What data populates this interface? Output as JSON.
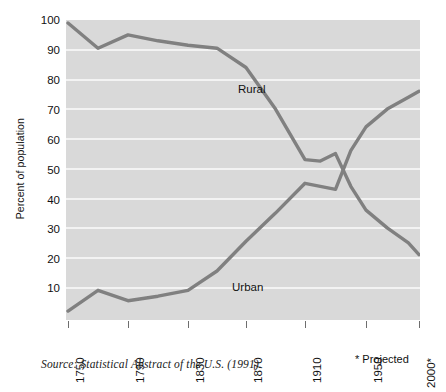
{
  "chart_data": {
    "type": "line",
    "title": "",
    "xlabel": "",
    "ylabel": "Percent of population",
    "xlim": [
      1750,
      2000
    ],
    "ylim": [
      0,
      100
    ],
    "grid": true,
    "legend": "inline-labels",
    "x_ticks": [
      "1750",
      "1790",
      "1830",
      "1870",
      "1910",
      "1950",
      "2000*"
    ],
    "x_tick_values": [
      1750,
      1790,
      1830,
      1870,
      1910,
      1950,
      2000
    ],
    "y_ticks": [
      "10",
      "20",
      "30",
      "40",
      "50",
      "60",
      "70",
      "80",
      "90",
      "100"
    ],
    "y_tick_values": [
      10,
      20,
      30,
      40,
      50,
      60,
      70,
      80,
      90,
      100
    ],
    "x": [
      1750,
      1770,
      1790,
      1810,
      1830,
      1850,
      1870,
      1890,
      1910,
      1920,
      1930,
      1940,
      1950,
      1970,
      1990,
      2000
    ],
    "series": [
      {
        "name": "Rural",
        "color": "#808080",
        "values": [
          99,
          90.5,
          95,
          93,
          91.5,
          90.5,
          84,
          70,
          53,
          52.5,
          55,
          44,
          36,
          30,
          25,
          21
        ]
      },
      {
        "name": "Urban",
        "color": "#808080",
        "values": [
          2,
          9,
          5.5,
          7,
          9,
          15.5,
          25.5,
          35,
          45,
          44,
          43,
          56,
          64,
          70,
          74,
          76
        ]
      }
    ],
    "annotations": [
      {
        "name": "rural-label",
        "text": "Rural"
      },
      {
        "name": "urban-label",
        "text": "Urban"
      }
    ]
  },
  "footnotes": {
    "source": "Source: Statistical Abstract of the U.S. (1991).",
    "projected": "* Projected"
  },
  "colors": {
    "plot_background": "#d9d9d9",
    "gridline": "#f3f3f3",
    "line": "#808080",
    "text": "#111111"
  }
}
